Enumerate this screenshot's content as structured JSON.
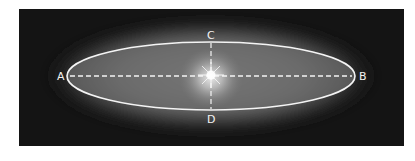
{
  "diagram": {
    "colors": {
      "background": "#ffffff",
      "panel": "#141414",
      "glow_outer": "#6e6e6e",
      "glow_inner": "#9a9a9a",
      "line": "#f4f4f4"
    },
    "ellipse": {
      "cx": 211,
      "cy": 76,
      "rx": 144,
      "ry": 34
    },
    "labels": {
      "a": "A",
      "b": "B",
      "c": "C",
      "d": "D"
    },
    "axes": {
      "major": {
        "from": "A",
        "to": "B",
        "style": "dashed"
      },
      "minor": {
        "from": "C",
        "to": "D",
        "style": "dashed"
      }
    },
    "center_marker": "star"
  }
}
